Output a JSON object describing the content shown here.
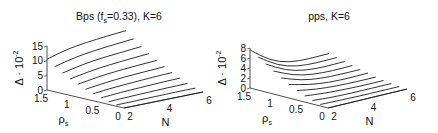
{
  "chart_data": [
    {
      "type": "line",
      "subtype": "3d-waterfall",
      "title": "Bps (f_s=0.33), K=6",
      "title_parts": {
        "main": "Bps (f",
        "sub": "s",
        "rest": "=0.33), K=6"
      },
      "xlabel": "N",
      "ylabel_main": "ρ",
      "ylabel_sub": "s",
      "zlabel_main": "Δ · 10",
      "zlabel_sup": "-2",
      "x_ticks": [
        "2",
        "4",
        "6"
      ],
      "y_ticks": [
        "1.5",
        "1",
        "0.5",
        "0"
      ],
      "z_ticks": [
        "0",
        "5",
        "10",
        "15"
      ],
      "xlim": [
        2,
        6
      ],
      "ylim": [
        0,
        1.5
      ],
      "zlim": [
        0,
        15
      ],
      "grid": false,
      "x": [
        2,
        3,
        4,
        5,
        6
      ],
      "series": [
        {
          "name": "rho_s=1.5",
          "rho": 1.5,
          "values": [
            10.5,
            12.5,
            13.5,
            14.2,
            14.8
          ]
        },
        {
          "name": "rho_s=1.35",
          "rho": 1.35,
          "values": [
            8.6,
            10.3,
            11.3,
            12.0,
            12.6
          ]
        },
        {
          "name": "rho_s=1.2",
          "rho": 1.2,
          "values": [
            7.0,
            8.5,
            9.4,
            10.0,
            10.6
          ]
        },
        {
          "name": "rho_s=1.05",
          "rho": 1.05,
          "values": [
            5.6,
            6.9,
            7.7,
            8.3,
            8.8
          ]
        },
        {
          "name": "rho_s=0.9",
          "rho": 0.9,
          "values": [
            4.4,
            5.5,
            6.2,
            6.7,
            7.1
          ]
        },
        {
          "name": "rho_s=0.75",
          "rho": 0.75,
          "values": [
            3.3,
            4.2,
            4.8,
            5.2,
            5.6
          ]
        },
        {
          "name": "rho_s=0.6",
          "rho": 0.6,
          "values": [
            2.4,
            3.1,
            3.5,
            3.9,
            4.2
          ]
        },
        {
          "name": "rho_s=0.45",
          "rho": 0.45,
          "values": [
            1.6,
            2.1,
            2.4,
            2.7,
            2.9
          ]
        },
        {
          "name": "rho_s=0.3",
          "rho": 0.3,
          "values": [
            0.9,
            1.2,
            1.4,
            1.6,
            1.7
          ]
        },
        {
          "name": "rho_s=0.15",
          "rho": 0.15,
          "values": [
            0.4,
            0.5,
            0.6,
            0.7,
            0.7
          ]
        },
        {
          "name": "rho_s=0",
          "rho": 0.0,
          "values": [
            0.0,
            0.0,
            0.0,
            0.0,
            0.0
          ]
        }
      ]
    },
    {
      "type": "line",
      "subtype": "3d-waterfall",
      "title": "pps, K=6",
      "title_parts": {
        "main": "pps, K=6",
        "sub": "",
        "rest": ""
      },
      "xlabel": "N",
      "ylabel_main": "ρ",
      "ylabel_sub": "s",
      "zlabel_main": "Δ · 10",
      "zlabel_sup": "-2",
      "x_ticks": [
        "2",
        "4",
        "6"
      ],
      "y_ticks": [
        "1.5",
        "1",
        "0.5",
        "0"
      ],
      "z_ticks": [
        "0",
        "2",
        "4",
        "6",
        "8"
      ],
      "xlim": [
        2,
        6
      ],
      "ylim": [
        0,
        1.5
      ],
      "zlim": [
        0,
        8
      ],
      "grid": false,
      "x": [
        2,
        3,
        4,
        5,
        6
      ],
      "series": [
        {
          "name": "rho_s=1.5",
          "rho": 1.5,
          "values": [
            7.6,
            4.6,
            3.2,
            3.0,
            3.1
          ]
        },
        {
          "name": "rho_s=1.35",
          "rho": 1.35,
          "values": [
            6.6,
            4.0,
            2.8,
            2.6,
            2.7
          ]
        },
        {
          "name": "rho_s=1.2",
          "rho": 1.2,
          "values": [
            5.6,
            3.4,
            2.4,
            2.2,
            2.3
          ]
        },
        {
          "name": "rho_s=1.05",
          "rho": 1.05,
          "values": [
            4.6,
            2.8,
            2.0,
            1.8,
            1.9
          ]
        },
        {
          "name": "rho_s=0.9",
          "rho": 0.9,
          "values": [
            3.6,
            2.2,
            1.6,
            1.5,
            1.5
          ]
        },
        {
          "name": "rho_s=0.75",
          "rho": 0.75,
          "values": [
            2.7,
            1.7,
            1.2,
            1.1,
            1.2
          ]
        },
        {
          "name": "rho_s=0.6",
          "rho": 0.6,
          "values": [
            1.9,
            1.2,
            0.9,
            0.8,
            0.8
          ]
        },
        {
          "name": "rho_s=0.45",
          "rho": 0.45,
          "values": [
            1.2,
            0.8,
            0.6,
            0.5,
            0.5
          ]
        },
        {
          "name": "rho_s=0.3",
          "rho": 0.3,
          "values": [
            0.7,
            0.4,
            0.3,
            0.3,
            0.3
          ]
        },
        {
          "name": "rho_s=0.15",
          "rho": 0.15,
          "values": [
            0.3,
            0.2,
            0.1,
            0.1,
            0.1
          ]
        },
        {
          "name": "rho_s=0",
          "rho": 0.0,
          "values": [
            0.0,
            0.0,
            0.0,
            0.0,
            0.0
          ]
        }
      ]
    }
  ]
}
